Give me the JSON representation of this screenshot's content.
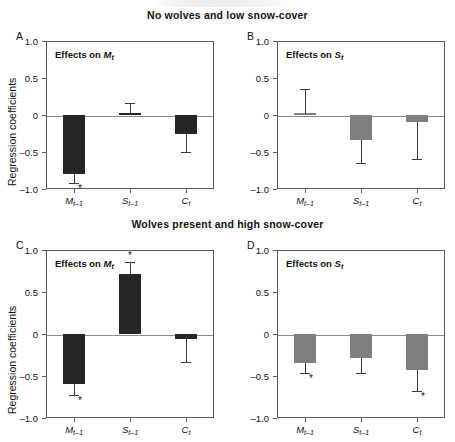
{
  "figure": {
    "titles": {
      "top": "No wolves and low snow-cover",
      "bottom": "Wolves present and high snow-cover"
    },
    "y_axis_label": "Regression coefficients",
    "y_ticks": [
      "1.0",
      "0.5",
      "0",
      "–0.5",
      "–1.0"
    ],
    "x_tick_labels": [
      "M",
      "S",
      "C"
    ],
    "x_tick_subscripts": [
      "t–1",
      "t–1",
      "t"
    ],
    "panels": [
      {
        "letter": "A",
        "caption_prefix": "Effects on ",
        "caption_var": "M",
        "caption_sub": "t"
      },
      {
        "letter": "B",
        "caption_prefix": "Effects on ",
        "caption_var": "S",
        "caption_sub": "t"
      },
      {
        "letter": "C",
        "caption_prefix": "Effects on ",
        "caption_var": "M",
        "caption_sub": "t"
      },
      {
        "letter": "D",
        "caption_prefix": "Effects on ",
        "caption_var": "S",
        "caption_sub": "t"
      }
    ],
    "colors": {
      "dark_bar": "#262626",
      "gray_bar": "#7f7f7f",
      "axis": "#5a5a5a",
      "zero_line": "#8a8a8a"
    },
    "significance_marker": "*"
  },
  "chart_data": [
    {
      "type": "bar",
      "panel": "A",
      "title": "Effects on Mt",
      "group_title": "No wolves and low snow-cover",
      "xlabel": "",
      "ylabel": "Regression coefficients",
      "ylim": [
        -1.0,
        1.0
      ],
      "yticks": [
        1.0,
        0.5,
        0,
        -0.5,
        -1.0
      ],
      "grid": false,
      "bar_color": "#262626",
      "categories": [
        "M(t-1)",
        "S(t-1)",
        "C(t)"
      ],
      "values": [
        -0.8,
        0.02,
        -0.25
      ],
      "error_low": [
        -0.92,
        -0.02,
        -0.5
      ],
      "error_high": [
        -0.8,
        0.16,
        -0.25
      ],
      "significant": [
        true,
        false,
        false
      ]
    },
    {
      "type": "bar",
      "panel": "B",
      "title": "Effects on St",
      "group_title": "No wolves and low snow-cover",
      "xlabel": "",
      "ylabel": "Regression coefficients",
      "ylim": [
        -1.0,
        1.0
      ],
      "yticks": [
        1.0,
        0.5,
        0,
        -0.5,
        -1.0
      ],
      "grid": false,
      "bar_color": "#7f7f7f",
      "categories": [
        "M(t-1)",
        "S(t-1)",
        "C(t)"
      ],
      "values": [
        0.01,
        -0.34,
        -0.09
      ],
      "error_low": [
        0.01,
        -0.65,
        -0.59
      ],
      "error_high": [
        0.35,
        -0.34,
        -0.09
      ],
      "significant": [
        false,
        false,
        false
      ]
    },
    {
      "type": "bar",
      "panel": "C",
      "title": "Effects on Mt",
      "group_title": "Wolves present and high snow-cover",
      "xlabel": "",
      "ylabel": "Regression coefficients",
      "ylim": [
        -1.0,
        1.0
      ],
      "yticks": [
        1.0,
        0.5,
        0,
        -0.5,
        -1.0
      ],
      "grid": false,
      "bar_color": "#262626",
      "categories": [
        "M(t-1)",
        "S(t-1)",
        "C(t)"
      ],
      "values": [
        -0.59,
        0.72,
        -0.06
      ],
      "error_low": [
        -0.73,
        0.72,
        -0.33
      ],
      "error_high": [
        -0.59,
        0.86,
        -0.06
      ],
      "significant": [
        true,
        true,
        false
      ]
    },
    {
      "type": "bar",
      "panel": "D",
      "title": "Effects on St",
      "group_title": "Wolves present and high snow-cover",
      "xlabel": "",
      "ylabel": "Regression coefficients",
      "ylim": [
        -1.0,
        1.0
      ],
      "yticks": [
        1.0,
        0.5,
        0,
        -0.5,
        -1.0
      ],
      "grid": false,
      "bar_color": "#7f7f7f",
      "categories": [
        "M(t-1)",
        "S(t-1)",
        "C(t)"
      ],
      "values": [
        -0.35,
        -0.29,
        -0.43
      ],
      "error_low": [
        -0.47,
        -0.47,
        -0.68
      ],
      "error_high": [
        -0.35,
        -0.29,
        -0.43
      ],
      "significant": [
        true,
        false,
        true
      ]
    }
  ]
}
